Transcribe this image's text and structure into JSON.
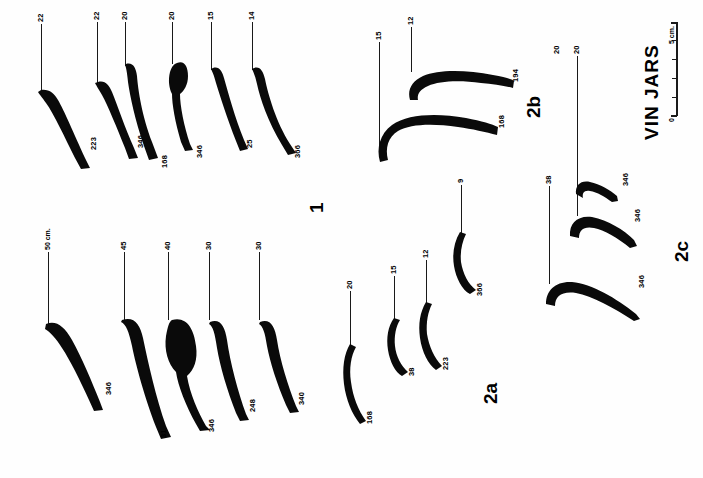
{
  "plate": {
    "title": "VIN  JARS",
    "orientation": "rotated-90",
    "groups": [
      {
        "id": "1",
        "label": "1",
        "rows": [
          {
            "row": "upper",
            "scale_label": "",
            "items": [
              {
                "top": "22",
                "bottom": "223"
              },
              {
                "top": "22",
                "bottom": "346"
              },
              {
                "top": "20",
                "bottom": "168"
              },
              {
                "top": "20",
                "bottom": "346"
              },
              {
                "top": "15",
                "bottom": "25"
              },
              {
                "top": "14",
                "bottom": "366"
              }
            ]
          },
          {
            "row": "lower",
            "scale_label": "50 cm.",
            "items": [
              {
                "top": "50 cm.",
                "bottom": "346"
              },
              {
                "top": "45",
                "bottom": "31"
              },
              {
                "top": "40",
                "bottom": "346"
              },
              {
                "top": "30",
                "bottom": "248"
              },
              {
                "top": "30",
                "bottom": "340"
              }
            ]
          }
        ]
      },
      {
        "id": "2a",
        "label": "2a",
        "items": [
          {
            "top": "20",
            "bottom": "168"
          },
          {
            "top": "15",
            "bottom": "38"
          },
          {
            "top": "12",
            "bottom": "223"
          },
          {
            "top": "9",
            "bottom": "366"
          }
        ]
      },
      {
        "id": "2b",
        "label": "2b",
        "items": [
          {
            "top": "15",
            "bottom": "168"
          },
          {
            "top": "12",
            "bottom": "194"
          }
        ]
      },
      {
        "id": "2c",
        "label": "2c",
        "items": [
          {
            "top": "38",
            "bottom": "346"
          },
          {
            "top": "20",
            "bottom": "346"
          },
          {
            "top": "20",
            "bottom": "346"
          }
        ]
      }
    ],
    "scale": {
      "zero_label": "0",
      "max_label": "5 cm.",
      "ticks": 5
    }
  }
}
